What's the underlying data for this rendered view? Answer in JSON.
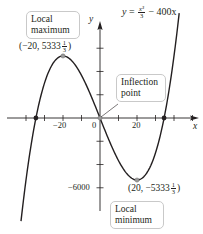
{
  "chart_data": {
    "type": "line",
    "title": "",
    "equation": {
      "lhs": "y",
      "num": "x³",
      "den": "3",
      "rest": "− 400x"
    },
    "xlabel": "x",
    "ylabel": "y",
    "xlim": [
      -52,
      52
    ],
    "ylim": [
      -9000,
      8200
    ],
    "grid": false,
    "x_ticks_step": 10,
    "y_ticks_step": 2000,
    "x_tick_labels": [
      {
        "value": -20,
        "label": "−20"
      },
      {
        "value": 20,
        "label": "20"
      }
    ],
    "y_tick_labels": [
      {
        "value": -6000,
        "label": "−6000"
      }
    ],
    "origin_label": "0",
    "series": [
      {
        "name": "y = x^3/3 - 400x",
        "function": "x^3/3 - 400x",
        "x_range": [
          -42.7,
          42.8
        ]
      }
    ],
    "points": [
      {
        "name": "local-maximum",
        "x": -20,
        "y": 5333.33,
        "label": "(−20, 5333",
        "frac": [
          "1",
          "3"
        ],
        "callout": [
          "Local",
          "maximum"
        ]
      },
      {
        "name": "inflection-point",
        "x": 0,
        "y": 0,
        "callout": [
          "Inflection",
          "point"
        ]
      },
      {
        "name": "local-minimum",
        "x": 20,
        "y": -5333.33,
        "label": "(20, −5333",
        "frac": [
          "1",
          "3"
        ],
        "callout": [
          "Local",
          "minimum"
        ]
      },
      {
        "name": "x-intercept-left",
        "x": -34.64,
        "y": 0
      },
      {
        "name": "x-intercept-right",
        "x": 34.64,
        "y": 0
      }
    ]
  }
}
